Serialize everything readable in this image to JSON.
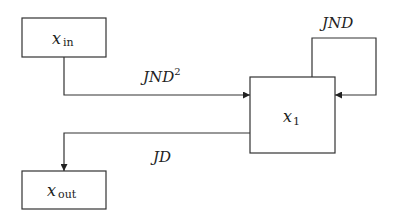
{
  "diagram": {
    "nodes": {
      "x_in": {
        "var": "x",
        "sub": "in"
      },
      "x_1": {
        "var": "x",
        "sub": "1"
      },
      "x_out": {
        "var": "x",
        "sub": "out"
      }
    },
    "edges": {
      "in_to_x1": {
        "label": "JND",
        "sup": "2"
      },
      "x1_loop": {
        "label": "JND"
      },
      "x1_to_out": {
        "label": "JD"
      }
    },
    "colors": {
      "stroke": "#333333",
      "background": "#ffffff"
    }
  }
}
